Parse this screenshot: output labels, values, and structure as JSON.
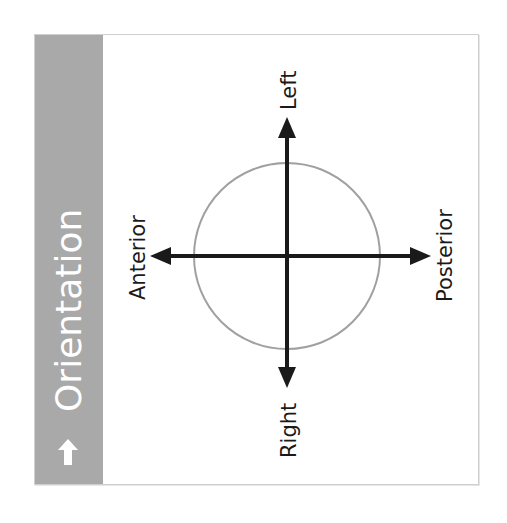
{
  "panel": {
    "title": "Orientation",
    "title_icon": "arrow-up-icon",
    "sidebar_color": "#a9a9a9",
    "title_color": "#ffffff"
  },
  "diagram": {
    "labels": {
      "top": "Left",
      "bottom": "Right",
      "left": "Anterior",
      "right": "Posterior"
    },
    "circle_color": "#a0a0a0",
    "arrow_color": "#1a1a1a"
  }
}
